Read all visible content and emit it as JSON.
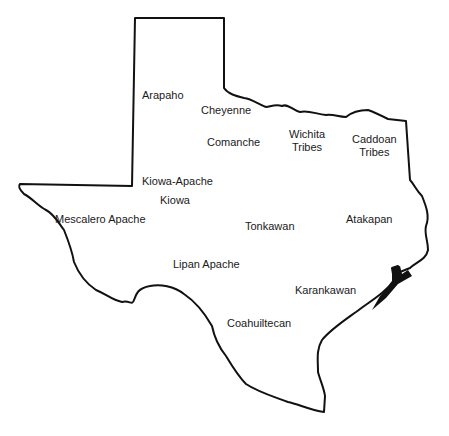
{
  "map": {
    "region": "Texas",
    "outline_color": "#111111",
    "background": "#ffffff",
    "tribes": [
      {
        "id": "arapaho",
        "name": "Arapaho",
        "x": 142,
        "y": 89
      },
      {
        "id": "cheyenne",
        "name": "Cheyenne",
        "x": 201,
        "y": 104
      },
      {
        "id": "comanche",
        "name": "Comanche",
        "x": 207,
        "y": 136
      },
      {
        "id": "wichita",
        "name": "Wichita\nTribes",
        "x": 289,
        "y": 128
      },
      {
        "id": "caddoan",
        "name": "Caddoan\nTribes",
        "x": 352,
        "y": 133
      },
      {
        "id": "kiowa-apache",
        "name": "Kiowa-Apache",
        "x": 142,
        "y": 175
      },
      {
        "id": "kiowa",
        "name": "Kiowa",
        "x": 160,
        "y": 194
      },
      {
        "id": "mescalero-apache",
        "name": "Mescalero Apache",
        "x": 55,
        "y": 213
      },
      {
        "id": "tonkawan",
        "name": "Tonkawan",
        "x": 245,
        "y": 220
      },
      {
        "id": "atakapan",
        "name": "Atakapan",
        "x": 346,
        "y": 213
      },
      {
        "id": "lipan-apache",
        "name": "Lipan Apache",
        "x": 173,
        "y": 258
      },
      {
        "id": "karankawan",
        "name": "Karankawan",
        "x": 295,
        "y": 284
      },
      {
        "id": "coahuiltecan",
        "name": "Coahuiltecan",
        "x": 227,
        "y": 317
      }
    ]
  }
}
